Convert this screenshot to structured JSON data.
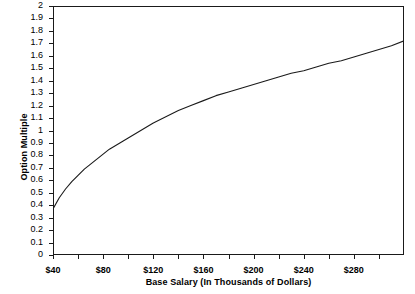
{
  "chart_data": {
    "type": "line",
    "title": "",
    "xlabel": "Base Salary (In Thousands of Dollars)",
    "ylabel": "Option Multiple",
    "xlim": [
      40,
      320
    ],
    "ylim": [
      0,
      2
    ],
    "grid": false,
    "legend": false,
    "x_tick_labels": [
      "$40",
      "$80",
      "$120",
      "$160",
      "$200",
      "$240",
      "$280"
    ],
    "x_tick_values": [
      40,
      80,
      120,
      160,
      200,
      240,
      280
    ],
    "x_minor_tick_values": [
      60,
      100,
      140,
      180,
      220,
      260,
      300
    ],
    "y_tick_labels": [
      "0",
      "0.1",
      "0.2",
      "0.3",
      "0.4",
      "0.5",
      "0.6",
      "0.7",
      "0.8",
      "0.9",
      "1",
      "1.1",
      "1.2",
      "1.3",
      "1.4",
      "1.5",
      "1.6",
      "1.7",
      "1.8",
      "1.9",
      "2"
    ],
    "y_tick_values": [
      0,
      0.1,
      0.2,
      0.3,
      0.4,
      0.5,
      0.6,
      0.7,
      0.8,
      0.9,
      1,
      1.1,
      1.2,
      1.3,
      1.4,
      1.5,
      1.6,
      1.7,
      1.8,
      1.9,
      2
    ],
    "series": [
      {
        "name": "Option Multiple",
        "color": "#1a1a1a",
        "x": [
          40,
          45,
          50,
          55,
          60,
          65,
          70,
          75,
          80,
          85,
          90,
          95,
          100,
          110,
          120,
          130,
          140,
          150,
          160,
          170,
          180,
          190,
          200,
          210,
          220,
          230,
          240,
          250,
          260,
          270,
          280,
          290,
          300,
          310,
          320
        ],
        "y": [
          0.37,
          0.46,
          0.53,
          0.59,
          0.64,
          0.69,
          0.73,
          0.77,
          0.81,
          0.85,
          0.88,
          0.91,
          0.94,
          1.0,
          1.06,
          1.11,
          1.16,
          1.2,
          1.24,
          1.28,
          1.31,
          1.34,
          1.37,
          1.4,
          1.43,
          1.46,
          1.48,
          1.51,
          1.54,
          1.56,
          1.59,
          1.62,
          1.65,
          1.68,
          1.72
        ]
      }
    ]
  }
}
